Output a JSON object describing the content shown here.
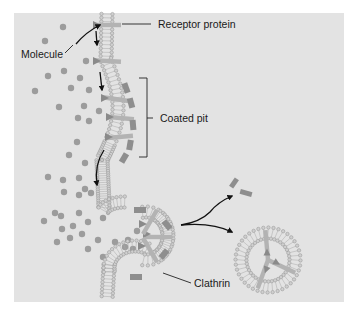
{
  "figure": {
    "labels": {
      "molecule": "Molecule",
      "receptor_protein": "Receptor protein",
      "coated_pit": "Coated pit",
      "clathrin": "Clathrin"
    },
    "icons": {
      "molecule": "circle-dot",
      "receptor": "bar",
      "ligand": "triangle",
      "clathrin": "rectangle",
      "vesicle": "circle-bilayer"
    },
    "colors": {
      "panel": "#e3e3e3",
      "molecule": "#9c9c9c",
      "membrane": "#cfcfcf",
      "receptor": "#b3b3b3",
      "clathrin": "#8e8e8e",
      "text": "#1a1a1a"
    }
  }
}
